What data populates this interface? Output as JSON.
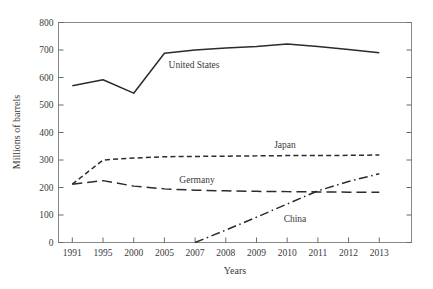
{
  "chart_data": {
    "type": "line",
    "title": "",
    "xlabel": "Years",
    "ylabel": "Millions of barrels",
    "categories": [
      "1991",
      "1995",
      "2000",
      "2005",
      "2007",
      "2008",
      "2009",
      "2010",
      "2011",
      "2012",
      "2013"
    ],
    "ylim": [
      0,
      800
    ],
    "yticks": [
      0,
      100,
      200,
      300,
      400,
      500,
      600,
      700,
      800
    ],
    "grid": false,
    "legend": "inline-labels",
    "series": [
      {
        "name": "United States",
        "style": "solid",
        "label_position": "inline",
        "values": [
          570,
          592,
          543,
          688,
          700,
          707,
          713,
          722,
          713,
          702,
          690
        ]
      },
      {
        "name": "Japan",
        "style": "short-dash",
        "label_position": "inline",
        "values": [
          212,
          300,
          307,
          312,
          313,
          314,
          315,
          316,
          316,
          317,
          318
        ]
      },
      {
        "name": "Germany",
        "style": "long-dash",
        "label_position": "inline",
        "values": [
          212,
          225,
          205,
          195,
          190,
          188,
          186,
          185,
          184,
          183,
          183
        ]
      },
      {
        "name": "China",
        "style": "dash-dot",
        "label_position": "inline",
        "values": [
          null,
          null,
          null,
          null,
          0,
          45,
          92,
          140,
          188,
          222,
          250
        ]
      }
    ]
  },
  "axis": {
    "y_tick_labels": [
      "800",
      "700",
      "600",
      "500",
      "400",
      "300",
      "200",
      "100",
      "0"
    ],
    "x_tick_labels": [
      "1991",
      "1995",
      "2000",
      "2005",
      "2007",
      "2008",
      "2009",
      "2010",
      "2011",
      "2012",
      "2013"
    ],
    "y_axis_title": "Millions of barrels",
    "x_axis_title": "Years"
  },
  "annotations": {
    "united_states": "United States",
    "japan": "Japan",
    "germany": "Germany",
    "china": "China"
  },
  "colors": {
    "line": "#2b2b2b",
    "frame": "#888888",
    "text": "#3a3a3a",
    "background": "#ffffff"
  }
}
